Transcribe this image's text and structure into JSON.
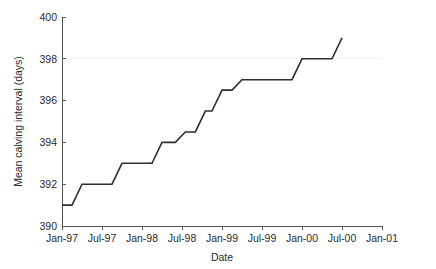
{
  "chart_data": {
    "type": "line",
    "title": "",
    "subtitle": "",
    "xlabel": "Date",
    "ylabel": "Mean calving interval (days)",
    "xlim": [
      0,
      48
    ],
    "ylim": [
      390,
      400
    ],
    "grid": "faint horizontal gridline at y = 398 only",
    "legend": "none",
    "x_tick_labels": [
      "Jan-97",
      "Jul-97",
      "Jan-98",
      "Jul-98",
      "Jan-99",
      "Jul-99",
      "Jan-00",
      "Jul-00",
      "Jan-01"
    ],
    "x_tick_values": [
      0,
      6,
      12,
      18,
      24,
      30,
      36,
      42,
      48
    ],
    "y_tick_labels": [
      "390",
      "392",
      "394",
      "396",
      "398",
      "400"
    ],
    "y_tick_values": [
      390,
      392,
      394,
      396,
      398,
      400
    ],
    "x_units": "months since Jan-97",
    "series": [
      {
        "name": "Mean calving interval",
        "color": "#2e2e2e",
        "style": "step-like rising line",
        "x": [
          0,
          1.5,
          3.0,
          7.5,
          9.0,
          13.5,
          15.0,
          17.0,
          18.5,
          20.0,
          21.5,
          22.5,
          24.0,
          25.5,
          27.0,
          34.5,
          36.0,
          40.5,
          42.0
        ],
        "y": [
          391.0,
          391.0,
          392.0,
          392.0,
          393.0,
          393.0,
          394.0,
          394.0,
          394.5,
          394.5,
          395.5,
          395.5,
          396.5,
          396.5,
          397.0,
          397.0,
          398.0,
          398.0,
          399.0
        ]
      }
    ]
  },
  "axes": {
    "y_axis_title": "Mean calving interval (days)",
    "x_axis_title": "Date"
  }
}
